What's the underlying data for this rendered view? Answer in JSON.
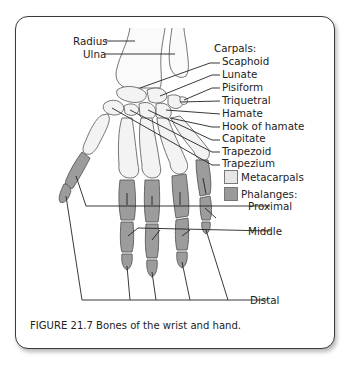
{
  "figure": {
    "caption": "FIGURE 21.7 Bones of the wrist and hand."
  },
  "labels": {
    "forearm": [
      {
        "text": "Radius"
      },
      {
        "text": "Ulna"
      }
    ],
    "carpals_heading": "Carpals:",
    "carpals": [
      {
        "text": "Scaphoid"
      },
      {
        "text": "Lunate"
      },
      {
        "text": "Pisiform"
      },
      {
        "text": "Triquetral"
      },
      {
        "text": "Hamate"
      },
      {
        "text": "Hook of hamate"
      },
      {
        "text": "Capitate"
      },
      {
        "text": "Trapezoid"
      },
      {
        "text": "Trapezium"
      }
    ],
    "legend": [
      {
        "text": "Metacarpals",
        "color": "#e6e6e6"
      },
      {
        "text": "Phalanges:",
        "color": "#9a9a9a"
      }
    ],
    "phalanges": [
      {
        "text": "Proximal"
      },
      {
        "text": "Middle"
      },
      {
        "text": "Distal"
      }
    ]
  },
  "colors": {
    "bone_light": "#f2f2f2",
    "bone_dark": "#9c9c9c",
    "outline": "#555555",
    "border": "#3a3a3a"
  }
}
